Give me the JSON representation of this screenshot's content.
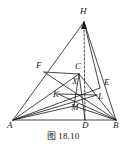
{
  "figure": {
    "caption": "图 18.10",
    "background_color": "#ffffff",
    "stroke_color": "#1a1a1a",
    "width": 126,
    "height": 150,
    "points": [
      {
        "id": "A",
        "label": "A",
        "x": 13,
        "y": 120,
        "label_x": 7,
        "label_y": 121
      },
      {
        "id": "B",
        "label": "B",
        "x": 116,
        "y": 120,
        "label_x": 113,
        "label_y": 121
      },
      {
        "id": "D",
        "label": "D",
        "x": 85,
        "y": 120,
        "label_x": 82,
        "label_y": 121
      },
      {
        "id": "H",
        "label": "H",
        "x": 84,
        "y": 22,
        "label_x": 80,
        "label_y": 7
      },
      {
        "id": "C",
        "label": "C",
        "x": 79,
        "y": 74,
        "label_x": 75,
        "label_y": 62
      },
      {
        "id": "F",
        "label": "F",
        "x": 44,
        "y": 72,
        "label_x": 36,
        "label_y": 61
      },
      {
        "id": "E",
        "label": "E",
        "x": 100,
        "y": 88,
        "label_x": 104,
        "label_y": 78
      },
      {
        "id": "K",
        "label": "K",
        "x": 58,
        "y": 94,
        "label_x": 53,
        "label_y": 90
      },
      {
        "id": "L",
        "label": "L",
        "x": 97,
        "y": 95,
        "label_x": 98,
        "label_y": 92
      },
      {
        "id": "X",
        "label": "X",
        "x": 75,
        "y": 86,
        "label_x": 72,
        "label_y": 77
      },
      {
        "id": "M",
        "label": "M",
        "x": 74,
        "y": 106,
        "label_x": 71,
        "label_y": 103
      }
    ],
    "segments": [
      {
        "name": "side-AB",
        "from": "A",
        "to": "B",
        "style": "solid"
      },
      {
        "name": "side-AH",
        "from": "A",
        "to": "H",
        "style": "solid"
      },
      {
        "name": "side-BH",
        "from": "B",
        "to": "H",
        "style": "solid"
      },
      {
        "name": "cevian-HD",
        "from": "H",
        "to": "D",
        "style": "dashed"
      },
      {
        "name": "cevian-AE",
        "from": "A",
        "to": "E",
        "style": "solid"
      },
      {
        "name": "cevian-BF",
        "from": "B",
        "to": "F",
        "style": "solid"
      },
      {
        "name": "segment-AC",
        "from": "A",
        "to": "C",
        "style": "solid"
      },
      {
        "name": "segment-BC",
        "from": "B",
        "to": "C",
        "style": "solid"
      },
      {
        "name": "segment-CD",
        "from": "C",
        "to": "D",
        "style": "solid"
      },
      {
        "name": "segment-AL",
        "from": "A",
        "to": "L",
        "style": "solid"
      },
      {
        "name": "segment-KB",
        "from": "K",
        "to": "B",
        "style": "solid"
      },
      {
        "name": "segment-KL",
        "from": "K",
        "to": "L",
        "style": "solid"
      },
      {
        "name": "segment-AM",
        "from": "A",
        "to": "M",
        "style": "solid"
      },
      {
        "name": "segment-MB",
        "from": "M",
        "to": "B",
        "style": "solid"
      },
      {
        "name": "segment-CM",
        "from": "C",
        "to": "M",
        "style": "solid"
      },
      {
        "name": "segment-HE",
        "from": "H",
        "to": "E",
        "style": "solid"
      },
      {
        "name": "segment-FC",
        "from": "F",
        "to": "C",
        "style": "solid"
      }
    ]
  }
}
